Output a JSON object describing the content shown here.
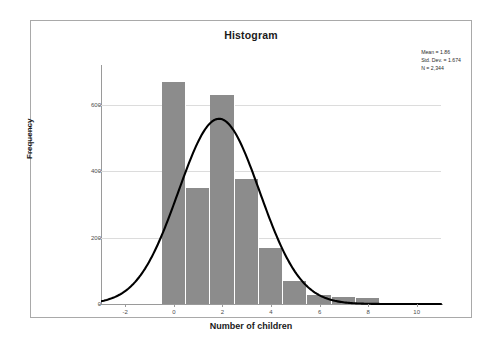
{
  "chart": {
    "title": "Histogram",
    "frame_border_color": "#a9a9a9",
    "bar_color": "#8c8c8c",
    "curve_color": "#000000",
    "gridline_color": "#dcdcdc"
  },
  "stats": {
    "mean_label": "Mean = 1.86",
    "stddev_label": "Std. Dev. = 1.674",
    "n_label": "N = 2,344"
  },
  "axes": {
    "y_title": "Frequency",
    "x_title": "Number of children",
    "y_ticks": [
      "0",
      "200",
      "400",
      "600"
    ],
    "x_ticks": [
      "-2",
      "0",
      "2",
      "4",
      "6",
      "8",
      "10"
    ]
  },
  "chart_data": {
    "type": "bar",
    "title": "Histogram",
    "xlabel": "Number of children",
    "ylabel": "Frequency",
    "categories": [
      "0",
      "1",
      "2",
      "3",
      "4",
      "5",
      "6",
      "7",
      "8"
    ],
    "values": [
      670,
      350,
      630,
      378,
      170,
      70,
      26,
      22,
      18
    ],
    "bin_width": 1,
    "bin_edges": [
      -0.5,
      0.5,
      1.5,
      2.5,
      3.5,
      4.5,
      5.5,
      6.5,
      7.5,
      8.5
    ],
    "xlim": [
      -3,
      11
    ],
    "ylim": [
      0,
      720
    ],
    "y_ticks": [
      0,
      200,
      400,
      600
    ],
    "x_ticks": [
      -2,
      0,
      2,
      4,
      6,
      8,
      10
    ],
    "grid": true,
    "legend": false,
    "overlay": {
      "type": "normal_curve",
      "mean": 1.86,
      "std_dev": 1.674,
      "n": 2344,
      "peak_value": 558
    },
    "annotations": [
      "Mean = 1.86",
      "Std. Dev. = 1.674",
      "N = 2,344"
    ]
  }
}
